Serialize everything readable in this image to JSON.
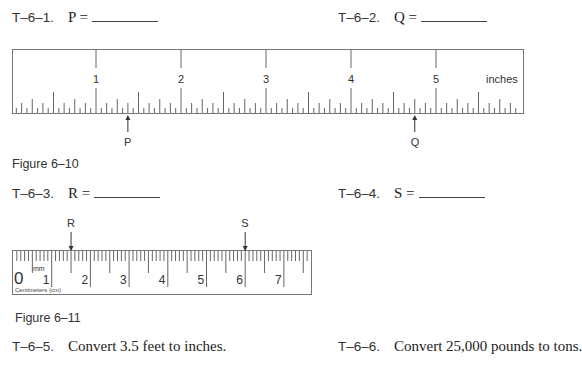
{
  "questions": [
    {
      "id": "T–6–1.",
      "text": "P =",
      "blank": true
    },
    {
      "id": "T–6–2.",
      "text": "Q =",
      "blank": true
    },
    {
      "id": "T–6–3.",
      "text": "R =",
      "blank": true
    },
    {
      "id": "T–6–4.",
      "text": "S =",
      "blank": true
    },
    {
      "id": "T–6–5.",
      "text": "Convert 3.5 feet to inches."
    },
    {
      "id": "T–6–6.",
      "text": "Convert 25,000 pounds to tons."
    }
  ],
  "figures": [
    {
      "caption": "Figure 6–10",
      "ruler": {
        "unit_label": "inches",
        "major_labels": [
          "1",
          "2",
          "3",
          "4",
          "5"
        ],
        "subdivisions": 16,
        "markers": [
          {
            "label": "P",
            "value_in": 1.375
          },
          {
            "label": "Q",
            "value_in": 4.75
          }
        ]
      }
    },
    {
      "caption": "Figure 6–11",
      "ruler": {
        "zero_label": "0",
        "mm_label": "mm",
        "unit_label": "Centimeters (cm)",
        "major_labels": [
          "1",
          "2",
          "3",
          "4",
          "5",
          "6",
          "7"
        ],
        "subdivisions": 10,
        "markers": [
          {
            "label": "R",
            "value_cm": 1.5
          },
          {
            "label": "S",
            "value_cm": 6.0
          }
        ]
      }
    }
  ]
}
